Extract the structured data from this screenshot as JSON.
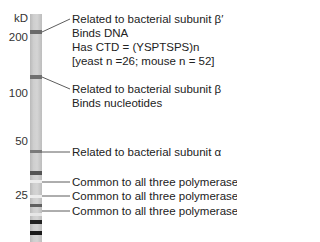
{
  "axis": {
    "unit": "kD",
    "ticks": [
      {
        "label": "200",
        "y": 38
      },
      {
        "label": "100",
        "y": 94
      },
      {
        "label": "50",
        "y": 142
      },
      {
        "label": "25",
        "y": 196
      }
    ]
  },
  "bands": [
    {
      "y": 30,
      "h": 4,
      "color": "#6a6a6a"
    },
    {
      "y": 75,
      "h": 4,
      "color": "#707070"
    },
    {
      "y": 150,
      "h": 3,
      "color": "#7a7a7a"
    },
    {
      "y": 171,
      "h": 4,
      "color": "#555555"
    },
    {
      "y": 180,
      "h": 2,
      "color": "#e8e8e8"
    },
    {
      "y": 195,
      "h": 2,
      "color": "#e8e8e8"
    },
    {
      "y": 204,
      "h": 3,
      "color": "#606060"
    },
    {
      "y": 220,
      "h": 4,
      "color": "#222222"
    },
    {
      "y": 231,
      "h": 4,
      "color": "#1a1a1a"
    }
  ],
  "annotations": [
    {
      "lines": [
        "Related to bacterial subunit β′",
        "Binds DNA",
        "Has CTD = (YSPTSPS)n",
        "[yeast n =26; mouse n = 52]"
      ]
    },
    {
      "lines": [
        "Related to bacterial subunit β",
        "Binds nucleotides"
      ]
    },
    {
      "lines": [
        "Related to bacterial subunit α"
      ]
    },
    {
      "lines": [
        "Common to all three polymerases"
      ]
    },
    {
      "lines": [
        "Common to all three polymerases"
      ]
    },
    {
      "lines": [
        "Common to all three polymerases"
      ]
    }
  ]
}
